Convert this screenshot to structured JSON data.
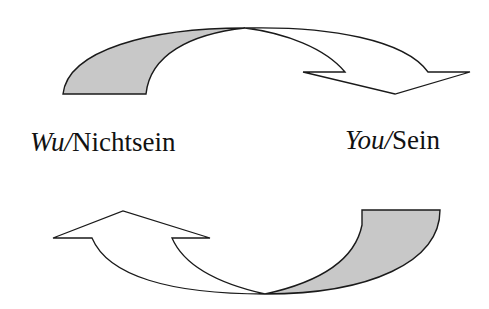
{
  "diagram": {
    "type": "cycle",
    "labels": {
      "left": {
        "italic": "Wu",
        "separator": "/",
        "plain": "Nichtsein"
      },
      "right": {
        "italic": "You",
        "separator": "/",
        "plain": "Sein"
      }
    },
    "arrows": [
      {
        "name": "top-arrow",
        "from": "left",
        "to": "right",
        "direction": "clockwise-over-top"
      },
      {
        "name": "bottom-arrow",
        "from": "right",
        "to": "left",
        "direction": "clockwise-under-bottom"
      }
    ],
    "colors": {
      "stroke": "#1a1a1a",
      "shaded_fill": "#c8c8c8",
      "arrow_fill": "#ffffff",
      "text": "#111111"
    }
  }
}
